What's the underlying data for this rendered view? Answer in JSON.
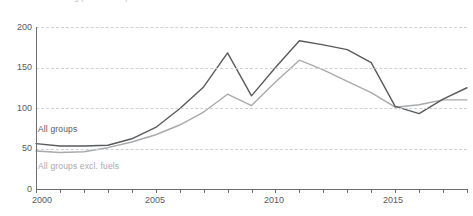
{
  "chart_data": {
    "type": "line",
    "title": "g (2010 = 100)",
    "xlabel": "",
    "ylabel": "",
    "x": [
      2000,
      2001,
      2002,
      2003,
      2004,
      2005,
      2006,
      2007,
      2008,
      2009,
      2010,
      2011,
      2012,
      2013,
      2014,
      2015,
      2016,
      2017,
      2018
    ],
    "xlim": [
      2000,
      2018
    ],
    "ylim": [
      0,
      200
    ],
    "yticks": [
      0,
      50,
      100,
      150,
      200
    ],
    "ytick_labels": [
      "0",
      "50",
      "100",
      "150",
      "200"
    ],
    "xticks": [
      2000,
      2001,
      2002,
      2003,
      2004,
      2005,
      2006,
      2007,
      2008,
      2009,
      2010,
      2011,
      2012,
      2013,
      2014,
      2015,
      2016,
      2017,
      2018
    ],
    "xtick_labels_shown": [
      {
        "value": 2000,
        "label": "2000"
      },
      {
        "value": 2005,
        "label": "2005"
      },
      {
        "value": 2010,
        "label": "2010"
      },
      {
        "value": 2015,
        "label": "2015"
      }
    ],
    "grid": true,
    "grid_style": "dashed",
    "legend_position": "inline-labels",
    "series": [
      {
        "name": "All groups",
        "color": "#595a5c",
        "values": [
          56,
          53,
          53,
          54,
          62,
          76,
          99,
          126,
          168,
          115,
          150,
          183,
          178,
          172,
          156,
          102,
          93,
          111,
          125
        ]
      },
      {
        "name": "All groups excl. fuels",
        "color": "#a7a9ac",
        "values": [
          47,
          45,
          46,
          51,
          58,
          67,
          79,
          95,
          117,
          103,
          132,
          159,
          147,
          133,
          119,
          101,
          104,
          110,
          110
        ]
      }
    ]
  },
  "axes": {
    "y_tick_labels": [
      "200",
      "150",
      "100",
      "50",
      "0"
    ],
    "x_tick_labels": [
      "2000",
      "2005",
      "2010",
      "2015"
    ]
  },
  "labels": {
    "series_dark": "All groups",
    "series_light": "All groups excl. fuels"
  },
  "colors": {
    "dark_series": "#595a5c",
    "light_series": "#a7a9ac",
    "grid": "#cfd0d2",
    "axis": "#6d6e71",
    "text": "#58595b",
    "title_text": "#b9babc",
    "background": "#ffffff"
  }
}
